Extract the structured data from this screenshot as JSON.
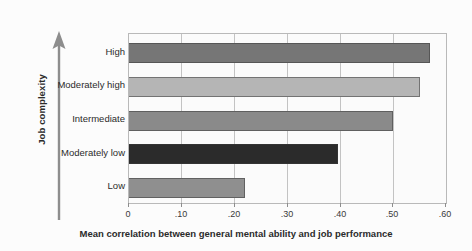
{
  "chart_data": {
    "type": "bar",
    "orientation": "horizontal",
    "title": "",
    "xlabel": "Mean correlation between general mental ability and job performance",
    "ylabel": "Job complexity",
    "categories": [
      "High",
      "Moderately high",
      "Intermediate",
      "Moderately low",
      "Low"
    ],
    "values": [
      0.57,
      0.55,
      0.5,
      0.395,
      0.22
    ],
    "xlim": [
      0,
      0.6
    ],
    "xticks": [
      0,
      0.1,
      0.2,
      0.3,
      0.4,
      0.5,
      0.6
    ],
    "xtick_labels": [
      "0",
      ".10",
      ".20",
      ".30",
      ".40",
      ".50",
      ".60"
    ],
    "grid": "vertical",
    "legend": "none",
    "bar_colors": [
      "#767676",
      "#b5b5b5",
      "#8a8a8a",
      "#2b2b2b",
      "#8f8f8f"
    ],
    "series": [
      {
        "name": "Mean correlation",
        "values": [
          0.57,
          0.55,
          0.5,
          0.395,
          0.22
        ]
      }
    ]
  },
  "axes": {
    "y_title": "Job complexity",
    "x_title": "Mean correlation between general mental ability and job performance",
    "y_arrow_icon": "up-arrow-icon"
  },
  "colors": {
    "plot_background": "#fbfbfb",
    "figure_background": "#fcfcfc",
    "frame": "#b9b9b9",
    "gridline": "#c3c3c3",
    "text": "#2b2b2b"
  }
}
